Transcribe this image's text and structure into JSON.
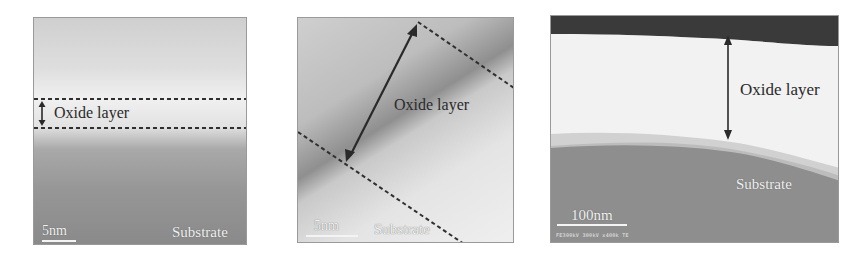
{
  "figure": {
    "panels": [
      {
        "id": "a",
        "type": "TEM micrograph",
        "labels": {
          "layer": "Oxide layer",
          "region": "Substrate"
        },
        "scale_bar": "5nm",
        "annotation": "double-headed arrow between two horizontal dashed lines"
      },
      {
        "id": "b",
        "type": "HRTEM micrograph",
        "labels": {
          "layer": "Oxide layer",
          "region": "Substrate"
        },
        "scale_bar": "5nm",
        "annotation": "diagonal double-headed arrow between two diagonal dashed lines"
      },
      {
        "id": "c",
        "type": "TEM micrograph",
        "labels": {
          "layer": "Oxide layer",
          "region": "Substrate"
        },
        "scale_bar": "100nm",
        "instrument_info": "FE300kV 300kV x400k TE",
        "annotation": "vertical double-headed arrow spanning the oxide layer"
      }
    ],
    "colors": {
      "annotation": "#2a2a2a",
      "dashed_line": "#2f2f2f",
      "scale_bar": "#f4f4f4",
      "substrate_gray": "#8e8e8e",
      "oxide_light": "#f2f2f2",
      "top_dark_band": "#3a3a3a"
    }
  }
}
